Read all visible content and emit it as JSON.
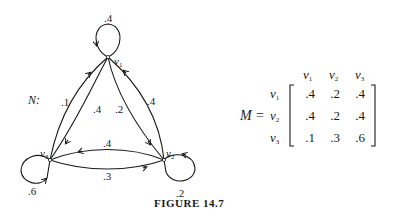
{
  "graph": {
    "name_label": "N:",
    "nodes": [
      {
        "id": "v1",
        "label": "v",
        "sub": "1"
      },
      {
        "id": "v2",
        "label": "v",
        "sub": "2"
      },
      {
        "id": "v3",
        "label": "v",
        "sub": "3"
      }
    ],
    "edges": {
      "v1_v1": ".4",
      "v1_v2": ".2",
      "v1_v3": ".4",
      "v2_v1": ".4",
      "v2_v2": ".2",
      "v2_v3": ".4",
      "v3_v1": ".1",
      "v3_v2": ".3",
      "v3_v3": ".6"
    }
  },
  "matrix": {
    "name": "M",
    "equals": "=",
    "col_headers": [
      {
        "v": "v",
        "sub": "1"
      },
      {
        "v": "v",
        "sub": "2"
      },
      {
        "v": "v",
        "sub": "3"
      }
    ],
    "row_headers": [
      {
        "v": "v",
        "sub": "1"
      },
      {
        "v": "v",
        "sub": "2"
      },
      {
        "v": "v",
        "sub": "3"
      }
    ],
    "rows": [
      [
        ".4",
        ".2",
        ".4"
      ],
      [
        ".4",
        ".2",
        ".4"
      ],
      [
        ".1",
        ".3",
        ".6"
      ]
    ]
  },
  "caption": "FIGURE 14.7"
}
